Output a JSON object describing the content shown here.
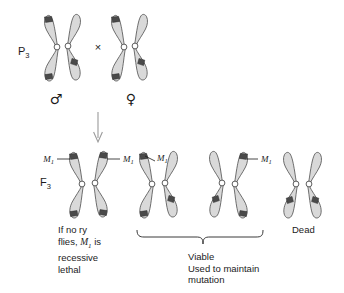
{
  "figure": {
    "type": "genetics-cross-diagram",
    "organism_context": "Drosophila balancer chromosome cross",
    "background_color": "#ffffff",
    "chromosome_fill": "#d9d9d9",
    "chromosome_outline": "#4d4d4d",
    "band_color": "#4a4a4a",
    "centromere_color": "#ffffff",
    "arrow_color": "#9a9a9a"
  },
  "generations": [
    {
      "id": "p3",
      "label_main": "P",
      "label_sub": "3",
      "cross_symbol": "×",
      "parents": [
        {
          "id": "male-parent",
          "sex_symbol": "♂",
          "sex_name": "male"
        },
        {
          "id": "female-parent",
          "sex_symbol": "♀",
          "sex_name": "female"
        }
      ]
    },
    {
      "id": "f3",
      "label_main": "F",
      "label_sub": "3",
      "offspring": [
        {
          "id": "offspring-1",
          "m1_labels": [
            "M1",
            "M1"
          ],
          "outcome": "recessive-lethal-note"
        },
        {
          "id": "offspring-2",
          "m1_labels": [
            "M1"
          ],
          "outcome": "viable"
        },
        {
          "id": "offspring-3",
          "m1_labels": [
            "M1"
          ],
          "outcome": "viable"
        },
        {
          "id": "offspring-4",
          "m1_labels": [],
          "outcome": "dead"
        }
      ]
    }
  ],
  "marker_label": {
    "text": "M",
    "subscript": "1"
  },
  "captions": {
    "left": {
      "line1": "If no ry",
      "line2_pre": "flies, ",
      "line2_marker": "M",
      "line2_marker_sub": "1",
      "line2_post": " is",
      "line3": "recessive",
      "line4": "lethal"
    },
    "middle": {
      "line1": "Viable",
      "line2": "Used to maintain",
      "line3": "mutation"
    },
    "right": {
      "line1": "Dead"
    }
  }
}
